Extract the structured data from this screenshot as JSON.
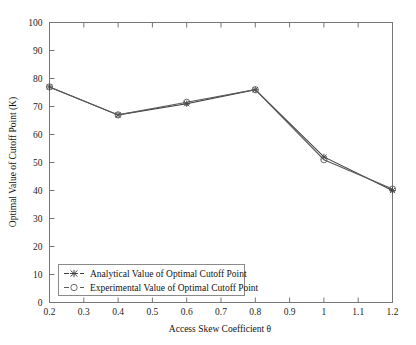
{
  "chart_data": {
    "type": "line",
    "title": "",
    "xlabel": "Access Skew Coefficient θ",
    "ylabel": "Optimal Value of Cutoff Point (K)",
    "x": [
      0.2,
      0.4,
      0.6,
      0.8,
      1.0,
      1.2
    ],
    "xlim": [
      0.2,
      1.2
    ],
    "ylim": [
      0,
      100
    ],
    "xticks": [
      0.2,
      0.3,
      0.4,
      0.5,
      0.6,
      0.7,
      0.8,
      0.9,
      1.0,
      1.1,
      1.2
    ],
    "xtick_labels": [
      "0.2",
      "0.3",
      "0.4",
      "0.5",
      "0.6",
      "0.7",
      "0.8",
      "0.9",
      "1",
      "1.1",
      "1.2"
    ],
    "yticks": [
      0,
      10,
      20,
      30,
      40,
      50,
      60,
      70,
      80,
      90,
      100
    ],
    "ytick_labels": [
      "0",
      "10",
      "20",
      "30",
      "40",
      "50",
      "60",
      "70",
      "80",
      "90",
      "100"
    ],
    "grid": false,
    "legend_position": "lower-left",
    "series": [
      {
        "name": "Analytical Value of Optimal Cutoff Point",
        "marker": "star-marker",
        "color": "#3f3f3f",
        "values": [
          77,
          67,
          71,
          76,
          52,
          40
        ]
      },
      {
        "name": "Experimental Value of Optimal Cutoff Point",
        "marker": "circle-marker",
        "color": "#5a5a5a",
        "values": [
          77,
          67,
          71.5,
          76,
          51,
          40.5
        ]
      }
    ]
  },
  "figure": {
    "background_color": "#ffffff",
    "axis_color": "#767676",
    "text_color": "#131313"
  }
}
